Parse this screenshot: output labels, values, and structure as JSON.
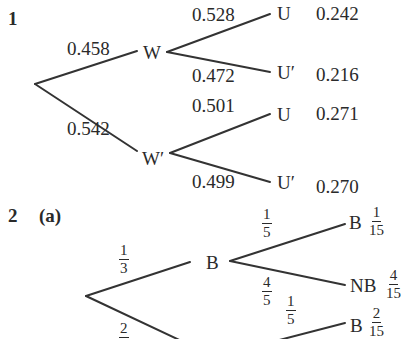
{
  "problem1": {
    "number": "1",
    "first_level": [
      {
        "prob": "0.458",
        "label": "W"
      },
      {
        "prob": "0.542",
        "label": "W′"
      }
    ],
    "second_level": {
      "W": [
        {
          "prob": "0.528",
          "label": "U",
          "joint": "0.242"
        },
        {
          "prob": "0.472",
          "label": "U′",
          "joint": "0.216"
        }
      ],
      "W_prime": [
        {
          "prob": "0.501",
          "label": "U",
          "joint": "0.271"
        },
        {
          "prob": "0.499",
          "label": "U′",
          "joint": "0.270"
        }
      ]
    }
  },
  "problem2": {
    "number": "2",
    "part": "(a)",
    "first_level": [
      {
        "prob_num": "1",
        "prob_den": "3",
        "label": "B"
      },
      {
        "prob_num": "2",
        "prob_den": "",
        "label": "NB"
      }
    ],
    "second_level": {
      "B": [
        {
          "prob_num": "1",
          "prob_den": "5",
          "label": "B",
          "joint_num": "1",
          "joint_den": "15"
        },
        {
          "prob_num": "4",
          "prob_den": "5",
          "label": "NB",
          "joint_num": "4",
          "joint_den": "15"
        }
      ],
      "NB": [
        {
          "prob_num": "1",
          "prob_den": "5",
          "label": "B",
          "joint_num": "2",
          "joint_den": "15"
        }
      ]
    }
  }
}
